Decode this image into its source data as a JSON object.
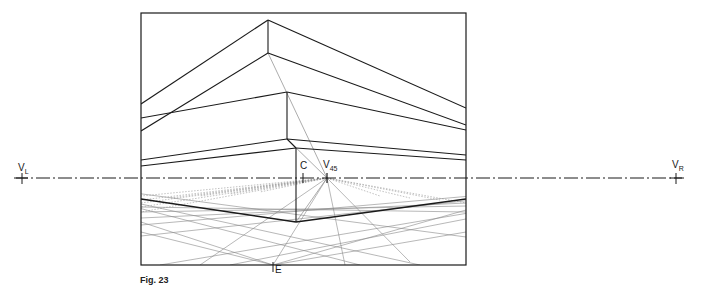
{
  "figure": {
    "caption": "Fig. 23"
  },
  "labels": {
    "vanishing_left": {
      "main": "V",
      "sub": "L"
    },
    "vanishing_right": {
      "main": "V",
      "sub": "R"
    },
    "vanishing_45": {
      "main": "V",
      "sub": "45"
    },
    "center": "C",
    "eye_point": "E"
  },
  "colors": {
    "line": "#1a1a1a",
    "construction": "#777777",
    "background": "#ffffff"
  },
  "geometry": {
    "frame": {
      "x": 141,
      "y": 13,
      "width": 325,
      "height": 252
    },
    "horizon_y": 178,
    "vl_x": 22,
    "vr_x": 676,
    "c_x": 303,
    "v45_x": 327,
    "e_point": [
      273,
      265
    ],
    "corner_base": [
      296,
      222
    ]
  }
}
